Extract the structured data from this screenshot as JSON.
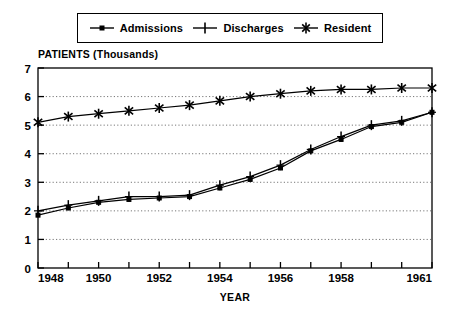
{
  "legend": {
    "position": "top-center",
    "entries": [
      {
        "label": "Admissions",
        "marker": "dot-marker-icon"
      },
      {
        "label": "Discharges",
        "marker": "plus-marker-icon"
      },
      {
        "label": "Resident",
        "marker": "asterisk-marker-icon"
      }
    ]
  },
  "axes": {
    "ylabel_top": "PATIENTS (Thousands)",
    "xlabel": "YEAR"
  },
  "chart_data": {
    "type": "line",
    "title": "",
    "subtitle": "",
    "xlabel": "YEAR",
    "ylabel": "PATIENTS (Thousands)",
    "xlim": [
      1948,
      1961
    ],
    "ylim": [
      0,
      7
    ],
    "ytick_values": [
      0,
      1,
      2,
      3,
      4,
      5,
      6,
      7
    ],
    "ytick_labels": [
      "0",
      "1",
      "2",
      "3",
      "4",
      "5",
      "6",
      "7"
    ],
    "xtick_values": [
      1948,
      1949,
      1950,
      1951,
      1952,
      1953,
      1954,
      1955,
      1956,
      1957,
      1958,
      1959,
      1960,
      1961
    ],
    "xtick_labels_shown": [
      "1948",
      "1950",
      "1952",
      "1954",
      "1956",
      "1958",
      "1961"
    ],
    "xtick_labeled_values": [
      1948,
      1950,
      1952,
      1954,
      1956,
      1958,
      1961
    ],
    "grid": "horizontal-dotted",
    "legend_position": "top-center",
    "x": [
      1948,
      1949,
      1950,
      1951,
      1952,
      1953,
      1954,
      1955,
      1956,
      1957,
      1958,
      1959,
      1960,
      1961
    ],
    "series": [
      {
        "name": "Admissions",
        "marker": "dot",
        "values": [
          1.85,
          2.1,
          2.3,
          2.4,
          2.45,
          2.5,
          2.8,
          3.1,
          3.5,
          4.1,
          4.5,
          4.95,
          5.1,
          5.45
        ]
      },
      {
        "name": "Discharges",
        "marker": "plus",
        "values": [
          2.0,
          2.2,
          2.35,
          2.5,
          2.5,
          2.55,
          2.9,
          3.2,
          3.6,
          4.15,
          4.6,
          5.0,
          5.15,
          5.45
        ]
      },
      {
        "name": "Resident",
        "marker": "asterisk",
        "values": [
          5.1,
          5.3,
          5.4,
          5.5,
          5.6,
          5.7,
          5.85,
          6.0,
          6.1,
          6.2,
          6.25,
          6.25,
          6.3,
          6.3
        ]
      }
    ]
  }
}
